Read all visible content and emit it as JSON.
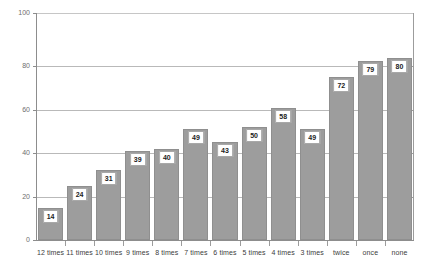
{
  "chart_data": {
    "type": "bar",
    "title": "",
    "subtitle": "",
    "xlabel": "",
    "ylabel": "",
    "categories": [
      "12 times",
      "11 times",
      "10 times",
      "9 times",
      "8 times",
      "7 times",
      "6 times",
      "5 times",
      "4 times",
      "3 times",
      "twice",
      "once",
      "none"
    ],
    "values": [
      14,
      24,
      31,
      39,
      40,
      49,
      43,
      50,
      58,
      49,
      72,
      79,
      80
    ],
    "ylim": [
      0,
      100
    ],
    "yticks": [
      0,
      20,
      40,
      60,
      80,
      100
    ],
    "ytick_labels": [
      "0",
      "20",
      "40",
      "60",
      "80",
      "100"
    ],
    "grid": true,
    "legend": false,
    "legend_position": "none",
    "data_labels": true,
    "bar_color": "#9d9d9d",
    "bar_edge_color": "#8f8f8f",
    "gridline_color": "#b9b9b9",
    "axis_color": "#8d8d8d",
    "label_box_bg": "#ffffff",
    "label_box_border": "#a8a8a8",
    "label_text_color": "#1c1c1c",
    "tick_text_color": "#6e6e6e",
    "category_text_color": "#3c3c3c",
    "background": "#ffffff"
  }
}
